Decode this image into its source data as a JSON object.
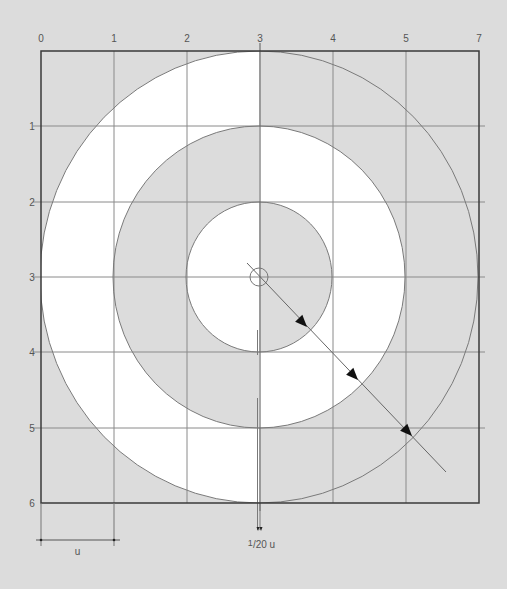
{
  "diagram": {
    "colors": {
      "background": "#dcdcdc",
      "fill_light": "#ffffff",
      "fill_dark": "#dcdcdc",
      "frame": "#3a3a3a",
      "grid": "#8a8a8a",
      "circle_stroke": "#7a7a7a",
      "arrow": "#111111",
      "label": "#555555"
    },
    "frame": {
      "x0": 41,
      "y0": 51,
      "x1": 479,
      "y1": 503
    },
    "x_axis": {
      "labels": [
        "0",
        "1",
        "2",
        "3",
        "4",
        "5",
        "7"
      ],
      "positions": [
        41,
        114,
        187,
        260,
        333,
        406,
        479
      ],
      "label_y": 42
    },
    "y_axis": {
      "labels": [
        "1",
        "2",
        "3",
        "4",
        "5",
        "6"
      ],
      "positions": [
        126,
        202,
        277,
        352,
        428,
        503
      ],
      "label_x": 32
    },
    "center": {
      "x": 259,
      "y": 277
    },
    "circles": [
      {
        "name": "outer",
        "rx": 219,
        "ry": 226,
        "left_fill": "light",
        "right_fill": "dark"
      },
      {
        "name": "middle",
        "rx": 146,
        "ry": 151,
        "left_fill": "dark",
        "right_fill": "light"
      },
      {
        "name": "inner",
        "rx": 73,
        "ry": 75,
        "left_fill": "light",
        "right_fill": "dark"
      }
    ],
    "center_marker_radius": 9,
    "diagonal": {
      "x1": 247,
      "y1": 263,
      "x2": 446,
      "y2": 472
    },
    "arrows": [
      {
        "x": 307,
        "y": 327
      },
      {
        "x": 358,
        "y": 380
      },
      {
        "x": 412,
        "y": 436
      }
    ],
    "dimensions": {
      "unit": {
        "label": "u",
        "x1": 41,
        "x2": 114,
        "y": 540
      },
      "gap": {
        "label": "1/20 u",
        "numerator": "1",
        "rest": "/20 u",
        "x1": 258,
        "x2": 261,
        "y": 531
      }
    }
  }
}
